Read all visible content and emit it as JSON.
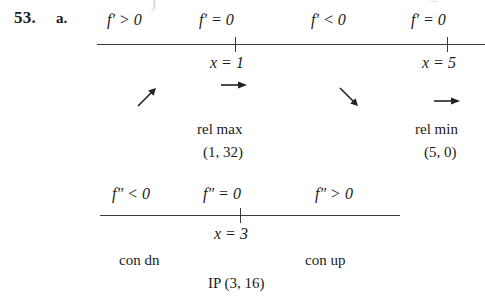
{
  "problem": {
    "number": "53.",
    "part": "a."
  },
  "first_derivative_line": {
    "signs": [
      {
        "text": "f′ > 0"
      },
      {
        "text": "f′ = 0"
      },
      {
        "text": "f′ < 0"
      },
      {
        "text": "f′ = 0"
      }
    ],
    "ticks": [
      {
        "label": "x = 1"
      },
      {
        "label": "x = 5"
      }
    ],
    "behavior_arrows": [
      {
        "icon": "arrow-up-right-icon",
        "glyph": "↗"
      },
      {
        "icon": "arrow-right-icon",
        "glyph": "→"
      },
      {
        "icon": "arrow-down-right-icon",
        "glyph": "↘"
      },
      {
        "icon": "arrow-right-icon",
        "glyph": "→"
      }
    ],
    "extrema": [
      {
        "type": "rel max",
        "point": "(1, 32)"
      },
      {
        "type": "rel min",
        "point": "(5, 0)"
      }
    ]
  },
  "second_derivative_line": {
    "signs": [
      {
        "text": "f″ < 0"
      },
      {
        "text": "f″ = 0"
      },
      {
        "text": "f″ > 0"
      }
    ],
    "ticks": [
      {
        "label": "x = 3"
      }
    ],
    "concavity": [
      {
        "text": "con dn"
      },
      {
        "text": "con up"
      }
    ],
    "inflection_point": "IP (3, 16)"
  },
  "colors": {
    "ink": "#1a1a1a",
    "rule": "#3b3b3b",
    "paper": "#ffffff"
  }
}
